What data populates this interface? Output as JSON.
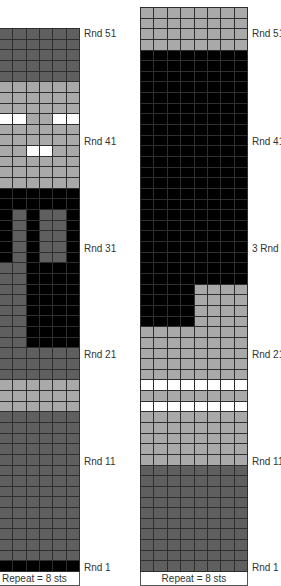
{
  "chart_data": [
    {
      "type": "heatmap",
      "name": "left-colorwork-chart",
      "note": "Cropped at left edge; 6 of 8 repeat stitches visible",
      "visible_columns": 6,
      "rows": 51,
      "legend": {
        "D": "dark grey",
        "L": "light grey",
        "K": "black",
        "W": "white"
      },
      "colors": {
        "D": "#5f5f5f",
        "L": "#a9a9a9",
        "K": "#000000",
        "W": "#ffffff"
      },
      "row_labels": [
        "Rnd 51",
        "Rnd 41",
        "Rnd 31",
        "Rnd 21",
        "Rnd 11",
        "Rnd 1"
      ],
      "footer": "Repeat = 8 sts",
      "grid_top_to_bottom": [
        "DDDDDD",
        "DDDDDD",
        "DDDDDD",
        "DDDDDD",
        "DDDDDD",
        "LLLLLL",
        "LLLLLL",
        "LLLLLL",
        "WWLLWW",
        "LLLLLL",
        "LLLLLL",
        "LLWWLL",
        "LLLLLL",
        "LLLLLL",
        "LLLLLL",
        "KKKKKK",
        "KKKKKK",
        "KDKDDK",
        "KDKDDK",
        "KDKDDK",
        "KDKDDK",
        "KDKDDK",
        "DDKKKK",
        "DDKKKK",
        "DDKKKK",
        "DDKKKK",
        "DDKKKK",
        "DDKKKK",
        "DDKKKK",
        "DDKKKK",
        "DDDDDD",
        "DDDDDD",
        "DDDDDD",
        "LLLLLL",
        "LLLLLL",
        "LLLLLL",
        "DDDDDD",
        "DDDDDD",
        "DDDDDD",
        "DDDDDD",
        "DDDDDD",
        "DDDDDD",
        "DDDDDD",
        "DDDDDD",
        "DDDDDD",
        "DDDDDD",
        "DDDDDD",
        "DDDDDD",
        "DDDDDD",
        "DDDDDD",
        "KKKKKK"
      ]
    },
    {
      "type": "heatmap",
      "name": "right-colorwork-chart",
      "visible_columns": 8,
      "rows": 53,
      "legend": {
        "D": "dark grey",
        "L": "light grey",
        "K": "black",
        "W": "white"
      },
      "colors": {
        "D": "#5f5f5f",
        "L": "#a9a9a9",
        "K": "#000000",
        "W": "#ffffff"
      },
      "row_labels": [
        "Rnd 51",
        "Rnd 41",
        "3 Rnd 1",
        "Rnd 21",
        "Rnd 11",
        "Rnd 1"
      ],
      "footer": "Repeat = 8 sts",
      "grid_top_to_bottom": [
        "LLLLLLLL",
        "LLLLLLLL",
        "LLLLLLLL",
        "LLLLLLLL",
        "KKKKKKKK",
        "KKKKKKKK",
        "KKKKKKKK",
        "KKKKKKKK",
        "KKKKKKKK",
        "KKKKKKKK",
        "KKKKKKKK",
        "KKKKKKKK",
        "KKKKKKKK",
        "KKKKKKKK",
        "KKKKKKKK",
        "KKKKKKKK",
        "KKKKKKKK",
        "KKKKKKKK",
        "KKKKKKKK",
        "KKKKKKKK",
        "KKKKKKKK",
        "KKKKKKKK",
        "KKKKKKKK",
        "KKKKKKKK",
        "KKKKKKKK",
        "KKKKKKKK",
        "KKKKLLLL",
        "KKKKLLLL",
        "KKKKLLLL",
        "KKKKLLLL",
        "LLLLLLLL",
        "LLLLLLLL",
        "LLLLLLLL",
        "LLLLLLLL",
        "LLLLLLLL",
        "WWWWWWWW",
        "LLLLLLLL",
        "WWWWWWWW",
        "LLLLLLLL",
        "LLLLLLLL",
        "LLLLLLLL",
        "LLLLLLLL",
        "LLLLLLLL",
        "DDDDDDDD",
        "DDDDDDDD",
        "DDDDDDDD",
        "DDDDDDDD",
        "DDDDDDDD",
        "DDDDDDDD",
        "DDDDDDDD",
        "DDDDDDDD",
        "DDDDDDDD",
        "DDDDDDDD"
      ]
    }
  ],
  "left": {
    "labels": [
      "Rnd 51",
      "Rnd 41",
      "Rnd 31",
      "Rnd 21",
      "Rnd 11",
      "Rnd 1"
    ],
    "footer": "Repeat = 8 sts"
  },
  "right": {
    "labels": [
      "Rnd 51",
      "Rnd 41",
      "3 Rnd 1",
      "Rnd 21",
      "Rnd 11",
      "Rnd 1"
    ],
    "footer": "Repeat = 8 sts"
  }
}
